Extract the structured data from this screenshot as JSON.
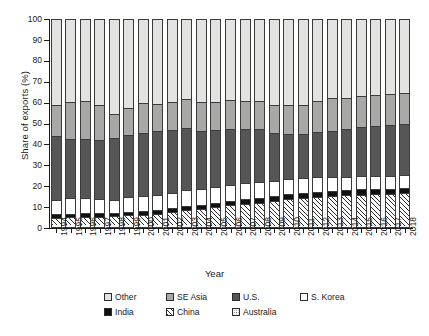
{
  "figure": {
    "background": "#ffffff"
  },
  "axes": {
    "y_title": "Share of exports (%)",
    "x_title": "Year",
    "y_ticks": [
      "0",
      "10",
      "20",
      "30",
      "40",
      "50",
      "60",
      "70",
      "80",
      "90",
      "100"
    ]
  },
  "legend": {
    "rows": [
      [
        {
          "label": "Other",
          "key": "other",
          "swatch": "light-gray-square"
        },
        {
          "label": "SE Asia",
          "key": "seasia",
          "swatch": "medium-gray-square"
        },
        {
          "label": "U.S.",
          "key": "us",
          "swatch": "dark-gray-square"
        },
        {
          "label": "S. Korea",
          "key": "skorea",
          "swatch": "white-square"
        }
      ],
      [
        {
          "label": "India",
          "key": "india",
          "swatch": "black-square"
        },
        {
          "label": "China",
          "key": "china",
          "swatch": "hatched-square"
        },
        {
          "label": "Australia",
          "key": "australia",
          "swatch": "dotted-square"
        }
      ]
    ]
  },
  "colors": {
    "other": "#e3e3e1",
    "seasia": "#a8a8a6",
    "us": "#565656",
    "skorea": "#ffffff",
    "india": "#111111",
    "china": "#ffffff",
    "australia": "#ffffff",
    "outline": "#3b3b3b",
    "text": "#1a1a1a"
  },
  "chart_data": {
    "type": "bar",
    "subtype": "100% stacked vertical bar",
    "title": "",
    "xlabel": "Year",
    "ylabel": "Share of exports (%)",
    "ylim": [
      0,
      100
    ],
    "yticks": [
      0,
      10,
      20,
      30,
      40,
      50,
      60,
      70,
      80,
      90,
      100
    ],
    "grid": false,
    "legend_position": "bottom",
    "stack_order_bottom_to_top": [
      "Australia",
      "China",
      "India",
      "S. Korea",
      "U.S.",
      "SE Asia",
      "Other"
    ],
    "categories": [
      "1994",
      "1995",
      "1996",
      "1997",
      "1998",
      "1999",
      "2000",
      "2001",
      "2002",
      "2003",
      "2004",
      "2005",
      "2006",
      "2007",
      "2008",
      "2009",
      "2010",
      "2011",
      "2012",
      "2013",
      "2014",
      "2015",
      "2016",
      "2017",
      "2018"
    ],
    "series": [
      {
        "name": "Australia",
        "values": [
          1.5,
          1.5,
          1.5,
          1.5,
          1.5,
          1.4,
          1.4,
          1.3,
          1.3,
          1.3,
          1.2,
          1.2,
          1.2,
          1.2,
          1.2,
          1.1,
          1.1,
          1.1,
          1.1,
          1.0,
          1.0,
          1.0,
          1.0,
          1.0,
          1.0
        ]
      },
      {
        "name": "China",
        "values": [
          3.5,
          3.7,
          3.8,
          4.0,
          4.2,
          4.6,
          5.0,
          5.6,
          6.3,
          7.2,
          8.0,
          8.8,
          9.6,
          10.4,
          11.0,
          12.0,
          12.8,
          13.4,
          13.8,
          14.2,
          14.6,
          15.0,
          15.2,
          15.4,
          15.6
        ]
      },
      {
        "name": "India",
        "values": [
          1.6,
          1.6,
          1.7,
          1.7,
          1.7,
          1.8,
          1.8,
          1.9,
          1.9,
          2.0,
          2.0,
          2.1,
          2.1,
          2.2,
          2.2,
          2.3,
          2.3,
          2.3,
          2.4,
          2.4,
          2.4,
          2.5,
          2.5,
          2.5,
          2.5
        ]
      },
      {
        "name": "S. Korea",
        "values": [
          6.6,
          7.4,
          7.3,
          6.9,
          6.2,
          7.0,
          7.2,
          6.9,
          7.3,
          7.5,
          7.6,
          7.6,
          7.8,
          7.6,
          7.4,
          7.3,
          7.2,
          7.0,
          6.9,
          6.7,
          6.6,
          6.5,
          6.3,
          6.2,
          6.1
        ]
      },
      {
        "name": "U.S.",
        "values": [
          30.6,
          28.6,
          28.4,
          28.0,
          29.4,
          29.7,
          30.2,
          30.6,
          30.1,
          29.7,
          27.8,
          27.2,
          26.9,
          26.0,
          25.5,
          23.0,
          21.8,
          21.3,
          21.9,
          22.3,
          22.6,
          23.3,
          23.9,
          24.2,
          24.4
        ]
      },
      {
        "name": "SE Asia",
        "values": [
          15.2,
          17.3,
          18.2,
          16.6,
          11.7,
          12.7,
          14.0,
          13.1,
          13.3,
          13.8,
          13.6,
          13.3,
          13.5,
          13.3,
          13.3,
          13.1,
          13.5,
          13.6,
          14.6,
          15.6,
          14.9,
          14.9,
          14.6,
          14.7,
          14.8
        ]
      },
      {
        "name": "Other",
        "values": [
          41.0,
          39.9,
          39.1,
          41.3,
          45.3,
          42.8,
          40.4,
          40.6,
          39.8,
          38.5,
          39.8,
          39.8,
          38.9,
          39.3,
          39.4,
          41.2,
          41.3,
          41.3,
          39.3,
          37.8,
          37.9,
          36.8,
          36.5,
          36.0,
          35.6
        ]
      }
    ]
  }
}
